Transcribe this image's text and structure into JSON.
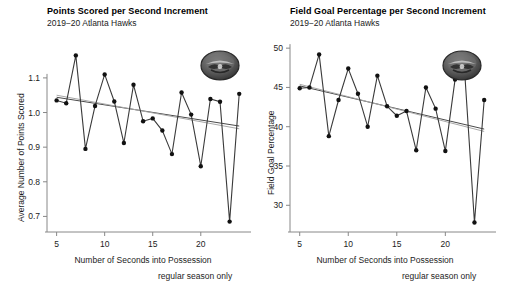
{
  "page": {
    "background": "#ffffff",
    "width": 505,
    "height": 296
  },
  "panels": [
    {
      "id": "points-panel",
      "title": "Points Scored per Second Increment",
      "subtitle": "2019−20 Atlanta Hawks",
      "xlabel": "Number of Seconds into Possession",
      "ylabel": "Average Number of Points Scored",
      "caption": "regular season only",
      "logo_name": "atlanta-hawks-logo"
    },
    {
      "id": "fg-panel",
      "title": "Field Goal Percentage per Second Increment",
      "subtitle": "2019−20 Atlanta Hawks",
      "xlabel": "Number of Seconds into Possession",
      "ylabel": "Field Goal Percentage",
      "caption": "regular season only",
      "logo_name": "atlanta-hawks-logo"
    }
  ],
  "colors": {
    "series_line": "#3a3a3a",
    "point_fill": "#111111",
    "fit_dark": "#4a4a4a",
    "fit_light": "#a8a8a8",
    "axis": "#888888",
    "text": "#1c1c1c"
  },
  "chart_data": [
    {
      "type": "line",
      "id": "points-per-second",
      "title": "Points Scored per Second Increment",
      "subtitle": "2019−20 Atlanta Hawks",
      "xlabel": "Number of Seconds into Possession",
      "ylabel": "Average Number of Points Scored",
      "caption": "regular season only",
      "grid": false,
      "legend": "none",
      "xlim": [
        4.0,
        24.6
      ],
      "ylim": [
        0.655,
        1.195
      ],
      "xticks": [
        5,
        10,
        15,
        20
      ],
      "yticks": [
        0.7,
        0.8,
        0.9,
        1.0,
        1.1
      ],
      "ytick_labels": [
        "0.7",
        "0.8",
        "0.9",
        "1.0",
        "1.1"
      ],
      "xtick_labels": [
        "5",
        "10",
        "15",
        "20"
      ],
      "x": [
        5,
        6,
        7,
        8,
        9,
        10,
        11,
        12,
        13,
        14,
        15,
        16,
        17,
        18,
        19,
        20,
        21,
        22,
        23,
        24
      ],
      "series": [
        {
          "name": "Average Number of Points Scored",
          "values": [
            1.035,
            1.027,
            1.165,
            0.895,
            1.019,
            1.11,
            1.032,
            0.912,
            1.08,
            0.975,
            0.983,
            0.948,
            0.88,
            1.058,
            0.994,
            0.845,
            1.039,
            1.031,
            0.685,
            1.054
          ]
        }
      ],
      "fits": [
        {
          "name": "linear-fit-dark",
          "color": "#4a4a4a",
          "x": [
            5,
            24
          ],
          "y": [
            1.044,
            0.961
          ]
        },
        {
          "name": "smooth-fit-light",
          "color": "#a8a8a8",
          "x": [
            5,
            24
          ],
          "y": [
            1.05,
            0.953
          ]
        }
      ]
    },
    {
      "type": "line",
      "id": "field-goal-percentage",
      "title": "Field Goal Percentage per Second Increment",
      "subtitle": "2019−20 Atlanta Hawks",
      "xlabel": "Number of Seconds into Possession",
      "ylabel": "Field Goal Percentage",
      "caption": "regular season only",
      "grid": false,
      "legend": "none",
      "xlim": [
        4.0,
        24.6
      ],
      "ylim": [
        26.6,
        50.4
      ],
      "xticks": [
        5,
        10,
        15,
        20
      ],
      "yticks": [
        30,
        35,
        40,
        45,
        50
      ],
      "ytick_labels": [
        "30",
        "35",
        "40",
        "45",
        "50"
      ],
      "xtick_labels": [
        "5",
        "10",
        "15",
        "20"
      ],
      "x": [
        5,
        6,
        7,
        8,
        9,
        10,
        11,
        12,
        13,
        14,
        15,
        16,
        17,
        18,
        19,
        20,
        21,
        22,
        23,
        24
      ],
      "series": [
        {
          "name": "Field Goal Percentage",
          "values": [
            44.9,
            45.0,
            49.2,
            38.8,
            43.4,
            47.4,
            44.2,
            40.0,
            46.5,
            42.6,
            41.4,
            42.0,
            37.0,
            45.0,
            42.3,
            36.9,
            46.0,
            46.8,
            27.8,
            43.4
          ]
        }
      ],
      "fits": [
        {
          "name": "linear-fit-dark",
          "color": "#4a4a4a",
          "x": [
            5,
            24
          ],
          "y": [
            45.2,
            39.7
          ]
        },
        {
          "name": "smooth-fit-light",
          "color": "#a8a8a8",
          "x": [
            5,
            24
          ],
          "y": [
            45.4,
            39.4
          ]
        }
      ]
    }
  ]
}
